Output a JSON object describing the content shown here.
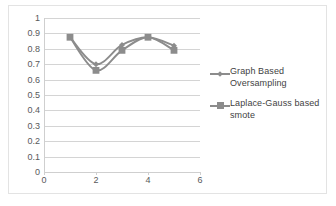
{
  "chart_data": {
    "type": "line",
    "title": "",
    "xlabel": "",
    "ylabel": "",
    "x": [
      1,
      2,
      3,
      4,
      5
    ],
    "xlim": [
      0,
      6
    ],
    "ylim": [
      0,
      1
    ],
    "grid": true,
    "legend_position": "right",
    "y_ticks": [
      "1",
      "0.9",
      "0.8",
      "0.7",
      "0.6",
      "0.5",
      "0.4",
      "0.3",
      "0.2",
      "0.1",
      "0"
    ],
    "y_tick_values": [
      1,
      0.9,
      0.8,
      0.7,
      0.6,
      0.5,
      0.4,
      0.3,
      0.2,
      0.1,
      0
    ],
    "x_ticks": [
      "0",
      "2",
      "4",
      "6"
    ],
    "x_tick_values": [
      0,
      2,
      4,
      6
    ],
    "series": [
      {
        "name": "Graph Based Oversampling",
        "values": [
          0.875,
          0.7,
          0.825,
          0.875,
          0.82
        ],
        "color": "#8c8c8c",
        "marker": "diamond"
      },
      {
        "name": "Laplace-Gauss based smote",
        "values": [
          0.875,
          0.66,
          0.79,
          0.875,
          0.79
        ],
        "color": "#8c8c8c",
        "marker": "square"
      }
    ]
  },
  "legend": {
    "entries": [
      {
        "label": "Graph Based Oversampling"
      },
      {
        "label": "Laplace-Gauss based smote"
      }
    ]
  },
  "colors": {
    "series_line": "#8c8c8c",
    "gridline": "#d4d4d4",
    "axis": "#cfcfcf",
    "tick_text": "#58595b",
    "legend_text": "#3f3f3f",
    "chart_border": "#e3e3e3",
    "background": "#ffffff"
  }
}
